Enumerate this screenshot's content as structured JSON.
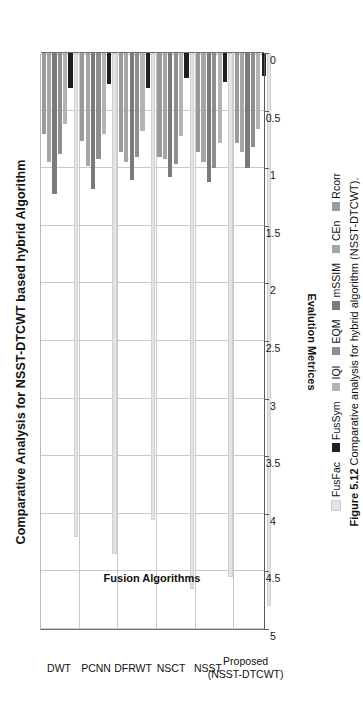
{
  "chart_data": {
    "type": "bar",
    "orientation": "horizontal",
    "title": "Comparative Analysis for NSST-DTCWT based hybrid Algorithm",
    "xlabel": "Evalution Metrices",
    "ylabel": "Fusion Algorithms",
    "categories": [
      "DWT",
      "PCNN",
      "DFRWT",
      "NSCT",
      "NSST",
      "Proposed (NSST-DTCWT)"
    ],
    "categories_display": [
      "DWT",
      "PCNN",
      "DFRWT",
      "NSCT",
      "NSST",
      "Proposed\n(NSST-DTCWT)"
    ],
    "axis_range": [
      0,
      5
    ],
    "tick_labels": [
      "0",
      "0.5",
      "1",
      "1.5",
      "2",
      "2.5",
      "3",
      "3.5",
      "4",
      "4.5",
      "5"
    ],
    "tick_values": [
      0,
      0.5,
      1,
      1.5,
      2,
      2.5,
      3,
      3.5,
      4,
      4.5,
      5
    ],
    "grid": true,
    "legend_position": "bottom",
    "series": [
      {
        "name": "FusFac",
        "color": "#e3e3e3",
        "values": [
          4.2,
          4.35,
          4.05,
          4.65,
          4.55,
          4.8
        ]
      },
      {
        "name": "FusSym",
        "color": "#1f1f1f",
        "values": [
          0.3,
          0.27,
          0.3,
          0.22,
          0.25,
          0.2
        ]
      },
      {
        "name": "IQI",
        "color": "#b3b3b3",
        "values": [
          0.62,
          0.7,
          0.68,
          0.72,
          0.78,
          0.66
        ]
      },
      {
        "name": "EQM",
        "color": "#8e8e8e",
        "values": [
          0.88,
          0.92,
          0.9,
          0.96,
          1.0,
          0.82
        ]
      },
      {
        "name": "mSSIM",
        "color": "#7a7a7a",
        "values": [
          1.22,
          1.18,
          1.1,
          1.08,
          1.12,
          1.0
        ]
      },
      {
        "name": "CEn",
        "color": "#a6a6a6",
        "values": [
          0.95,
          0.98,
          0.95,
          0.92,
          0.95,
          0.86
        ]
      },
      {
        "name": "Rcorr",
        "color": "#9a9a9a",
        "values": [
          0.7,
          0.76,
          0.86,
          0.9,
          0.86,
          0.78
        ]
      }
    ]
  },
  "caption": {
    "number": "Figure 5.12",
    "text": "Comparative analysis for hybrid algorithm (NSST-DTCWT)."
  },
  "colors": {
    "grid": "#c9c9c9",
    "axis": "#5b5b5b",
    "background": "#ffffff",
    "text": "#111111"
  }
}
